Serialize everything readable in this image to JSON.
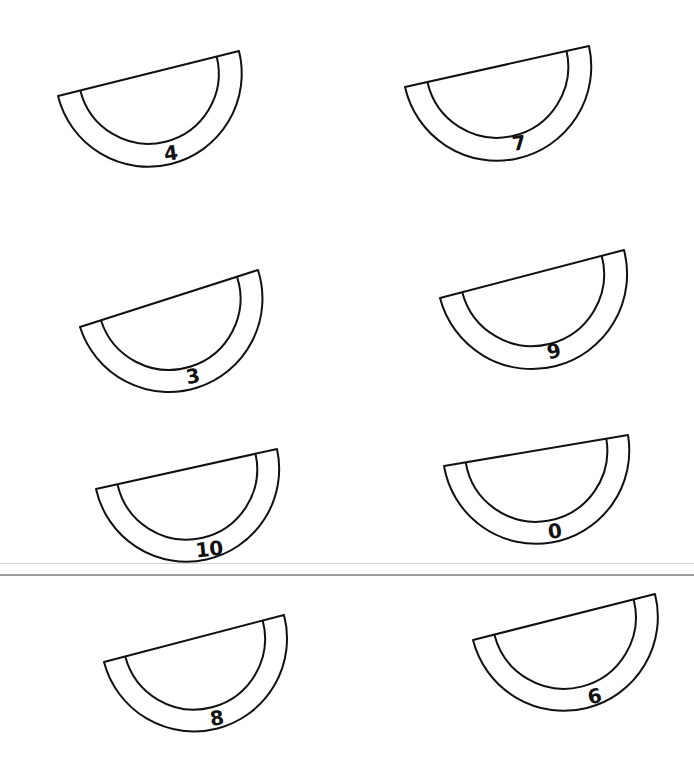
{
  "page": {
    "background": "#ffffff",
    "stroke_color": "#111111"
  },
  "slices": [
    {
      "label": "4",
      "ax": 58,
      "ay": 96,
      "bx": 239,
      "by": 51,
      "thick": 23,
      "tx": 172,
      "ty": 160,
      "rot": -8
    },
    {
      "label": "7",
      "ax": 405,
      "ay": 87,
      "bx": 589,
      "by": 46,
      "thick": 23,
      "tx": 520,
      "ty": 150,
      "rot": -8
    },
    {
      "label": "3",
      "ax": 80,
      "ay": 327,
      "bx": 258,
      "by": 270,
      "thick": 22,
      "tx": 194,
      "ty": 383,
      "rot": -10
    },
    {
      "label": "9",
      "ax": 440,
      "ay": 298,
      "bx": 624,
      "by": 250,
      "thick": 23,
      "tx": 555,
      "ty": 358,
      "rot": -10
    },
    {
      "label": "10",
      "ax": 96,
      "ay": 489,
      "bx": 277,
      "by": 449,
      "thick": 22,
      "tx": 210,
      "ty": 556,
      "rot": -6
    },
    {
      "label": "0",
      "ax": 444,
      "ay": 466,
      "bx": 628,
      "by": 435,
      "thick": 22,
      "tx": 556,
      "ty": 538,
      "rot": -8
    },
    {
      "label": "8",
      "ax": 104,
      "ay": 662,
      "bx": 284,
      "by": 615,
      "thick": 22,
      "tx": 218,
      "ty": 725,
      "rot": -8
    },
    {
      "label": "6",
      "ax": 473,
      "ay": 640,
      "bx": 655,
      "by": 594,
      "thick": 22,
      "tx": 596,
      "ty": 703,
      "rot": -12
    }
  ]
}
